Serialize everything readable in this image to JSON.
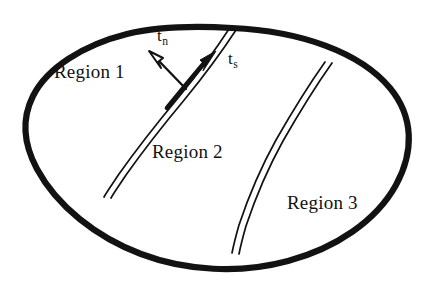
{
  "figure": {
    "type": "schematic-diagram",
    "background_color": "#ffffff",
    "ink_color": "#121212",
    "regions": [
      {
        "id": "region-1",
        "label": "Region 1"
      },
      {
        "id": "region-2",
        "label": "Region 2"
      },
      {
        "id": "region-3",
        "label": "Region 3"
      }
    ],
    "vectors": [
      {
        "id": "t-n",
        "symbol": "t",
        "subscript": "n",
        "meaning": "normal traction",
        "style": "thin-outlined-arrow",
        "direction": "up-left"
      },
      {
        "id": "t-s",
        "symbol": "t",
        "subscript": "s",
        "meaning": "tangential traction",
        "style": "thick-solid-arrow-along-interface",
        "direction": "up-right"
      }
    ],
    "interfaces": [
      {
        "id": "interface-1-2",
        "style": "double-line",
        "separates": [
          "Region 1",
          "Region 2"
        ]
      },
      {
        "id": "interface-2-3",
        "style": "double-line",
        "separates": [
          "Region 2",
          "Region 3"
        ]
      }
    ],
    "outer_boundary": {
      "id": "body-outline",
      "style": "thick-closed-curve",
      "shape": "tilted-ellipse"
    }
  }
}
